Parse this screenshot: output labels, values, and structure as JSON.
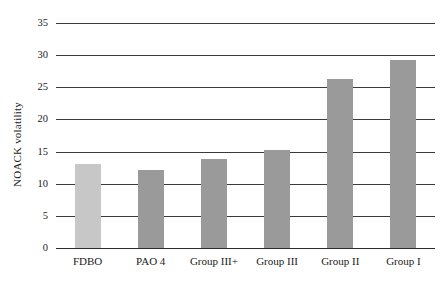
{
  "chart_data": {
    "type": "bar",
    "title": "",
    "xlabel": "",
    "ylabel": "NOACK volatility",
    "categories": [
      "FDBO",
      "PAO 4",
      "Group III+",
      "Group III",
      "Group II",
      "Group I"
    ],
    "values": [
      13.1,
      12.1,
      13.8,
      15.2,
      26.3,
      29.3
    ],
    "ylim": [
      0,
      35
    ],
    "yticks": [
      "0",
      "5",
      "10",
      "15",
      "20",
      "25",
      "30",
      "35"
    ],
    "ytick_values": [
      0,
      5,
      10,
      15,
      20,
      25,
      30,
      35
    ],
    "grid": true,
    "legend": "none",
    "series": [
      {
        "name": "NOACK volatility",
        "values": [
          13.1,
          12.1,
          13.8,
          15.2,
          26.3,
          29.3
        ]
      }
    ],
    "bar_colors": [
      "#c7c7c7",
      "#9a9a9a",
      "#9a9a9a",
      "#9a9a9a",
      "#9a9a9a",
      "#9a9a9a"
    ],
    "gridline_color": "#3a3a3a",
    "background": "#ffffff"
  }
}
